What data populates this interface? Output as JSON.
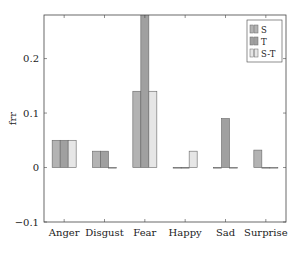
{
  "chart_data": {
    "type": "bar",
    "title": "",
    "xlabel": "",
    "ylabel": "frr",
    "categories": [
      "Anger",
      "Disgust",
      "Fear",
      "Happy",
      "Sad",
      "Surprise"
    ],
    "series": [
      {
        "name": "S",
        "color": "#b3b3b3",
        "values": [
          0.05,
          0.03,
          0.14,
          0.0,
          0.0,
          0.032
        ]
      },
      {
        "name": "T",
        "color": "#a0a0a0",
        "values": [
          0.05,
          0.03,
          0.32,
          0.0,
          0.09,
          0.0
        ]
      },
      {
        "name": "S-T",
        "color": "#e6e6e6",
        "values": [
          0.05,
          0.0,
          0.14,
          0.03,
          0.0,
          -0.001
        ]
      }
    ],
    "ylim": [
      -0.1,
      0.28
    ],
    "yticks": [
      -0.1,
      0,
      0.1,
      0.2
    ],
    "ytick_labels": [
      "−0.1",
      "0",
      "0.1",
      "0.2"
    ],
    "grid": false,
    "legend_position": "upper right"
  }
}
